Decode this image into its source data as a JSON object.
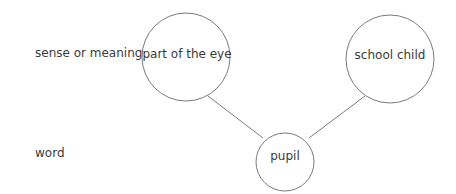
{
  "diagram": {
    "row_labels": {
      "sense": "sense or meaning",
      "word": "word"
    },
    "nodes": [
      {
        "id": "part-of-the-eye",
        "label": "part of the eye",
        "level": "sense"
      },
      {
        "id": "school-child",
        "label": "school child",
        "level": "sense"
      },
      {
        "id": "pupil",
        "label": "pupil",
        "level": "word"
      }
    ],
    "edges": [
      {
        "from": "pupil",
        "to": "part-of-the-eye"
      },
      {
        "from": "pupil",
        "to": "school-child"
      }
    ],
    "colors": {
      "stroke": "#7a7a7a",
      "text": "#3a3a3a",
      "background": "#ffffff"
    }
  }
}
